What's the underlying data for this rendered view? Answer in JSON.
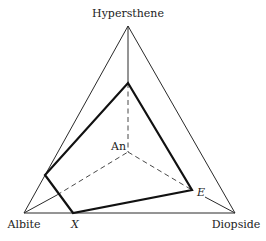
{
  "diagram": {
    "vertices": {
      "hypersthene": {
        "label": "Hypersthene",
        "x": 128,
        "y": 26
      },
      "albite": {
        "label": "Albite",
        "x": 24,
        "y": 213
      },
      "diopside": {
        "label": "Diopside",
        "x": 235,
        "y": 213
      },
      "an": {
        "label": "An",
        "x": 128,
        "y": 152
      }
    },
    "section_points": {
      "top": {
        "x": 128,
        "y": 83
      },
      "left": {
        "x": 45,
        "y": 175
      },
      "x": {
        "label": "X",
        "x": 73,
        "y": 213
      },
      "e": {
        "label": "E",
        "x": 192,
        "y": 190
      }
    },
    "labels": {
      "hypersthene": "Hypersthene",
      "albite": "Albite",
      "diopside": "Diopside",
      "an": "An",
      "x": "X",
      "e": "E"
    },
    "colors": {
      "line": "#2a2a2a",
      "section": "#111111",
      "text": "#222222"
    }
  }
}
